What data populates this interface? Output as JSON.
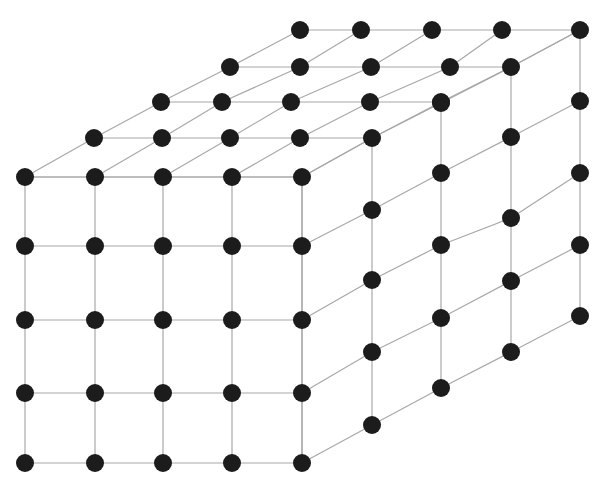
{
  "diagram": {
    "type": "3d-lattice-cube",
    "colors": {
      "node": "#1c1c1c",
      "edge": "#a8a8a8",
      "background": "#ffffff"
    },
    "node_radius": 9,
    "faces": {
      "front": {
        "cols_x": [
          25,
          95,
          163,
          232,
          302
        ],
        "rows_y": [
          177,
          246,
          320,
          393,
          463
        ]
      },
      "top": {
        "rows": [
          {
            "y": 177,
            "x": [
              25,
              95,
              163,
              232,
              302
            ]
          },
          {
            "y": 138,
            "x": [
              94,
              162,
              230,
              300,
              372
            ]
          },
          {
            "y": 102,
            "x": [
              161,
              222,
              291,
              370,
              441
            ]
          },
          {
            "y": 67,
            "x": [
              230,
              300,
              371,
              450,
              511
            ]
          },
          {
            "y": 30,
            "x": [
              300,
              361,
              432,
              502,
              580
            ]
          }
        ]
      },
      "right": {
        "cols": [
          {
            "x": 302,
            "y": [
              177,
              246,
              320,
              393,
              463
            ]
          },
          {
            "x": 372,
            "y": [
              138,
              210,
              280,
              352,
              425
            ]
          },
          {
            "x": 441,
            "y": [
              103,
              173,
              245,
              318,
              388
            ]
          },
          {
            "x": 511,
            "y": [
              67,
              137,
              218,
              281,
              352
            ]
          },
          {
            "x": 580,
            "y": [
              30,
              101,
              173,
              245,
              316
            ]
          }
        ]
      }
    }
  }
}
